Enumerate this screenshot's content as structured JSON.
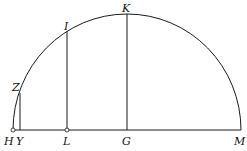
{
  "diagram": {
    "type": "geometric-figure",
    "stroke_color": "#1a1a1a",
    "background": "#ffffff",
    "points": {
      "H": {
        "label": "H",
        "x": 13,
        "y": 130
      },
      "Y": {
        "label": "Y",
        "x": 20,
        "y": 130
      },
      "L": {
        "label": "L",
        "x": 67,
        "y": 130
      },
      "G": {
        "label": "G",
        "x": 127,
        "y": 130
      },
      "M": {
        "label": "M",
        "x": 241,
        "y": 130
      },
      "Z": {
        "label": "Z",
        "x": 20,
        "y": 93
      },
      "I": {
        "label": "I",
        "x": 67,
        "y": 32
      },
      "K": {
        "label": "K",
        "x": 127,
        "y": 14
      }
    },
    "labels": {
      "H": "H",
      "Y": "Y",
      "L": "L",
      "G": "G",
      "M": "M",
      "Z": "Z",
      "I": "I",
      "K": "K"
    }
  }
}
